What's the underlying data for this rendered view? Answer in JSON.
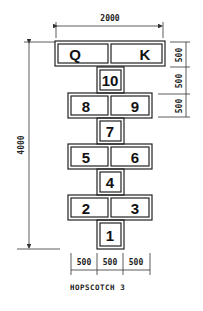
{
  "diagram": {
    "title": "HOPSCOTCH 3",
    "dimensions": {
      "overall_width": "2000",
      "overall_height": "4000",
      "right_top": "500",
      "right_middle": "500",
      "right_lower": "500",
      "bottom_left": "500",
      "bottom_center": "500",
      "bottom_right": "500"
    },
    "squares": {
      "q": "Q",
      "k": "K",
      "s10": "10",
      "s8": "8",
      "s9": "9",
      "s7": "7",
      "s5": "5",
      "s6": "6",
      "s4": "4",
      "s2": "2",
      "s3": "3",
      "s1": "1"
    }
  }
}
